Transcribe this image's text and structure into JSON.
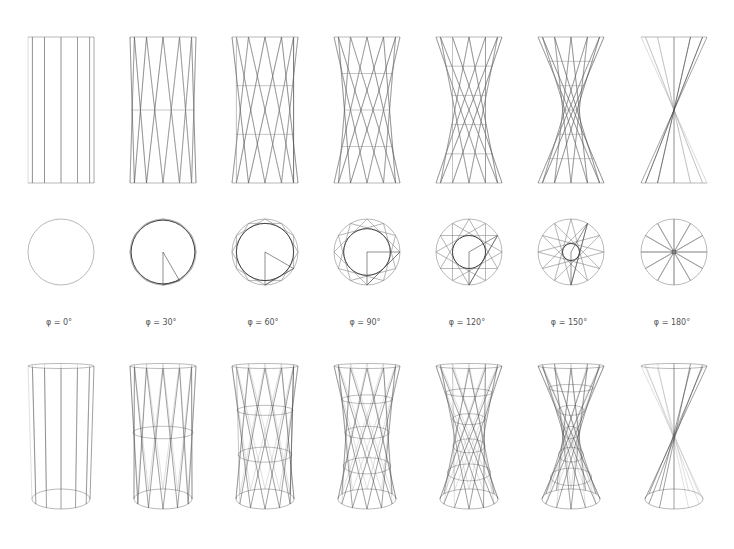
{
  "figure": {
    "rows": [
      "elevation",
      "plan",
      "perspective"
    ],
    "rod_count": 12,
    "line_color": "#8a8a8a",
    "dark_line_color": "#444444",
    "columns": [
      {
        "phi": 0,
        "label": "φ = 0°",
        "cx": 61
      },
      {
        "phi": 30,
        "label": "φ = 30°",
        "cx": 163
      },
      {
        "phi": 60,
        "label": "φ = 60°",
        "cx": 265
      },
      {
        "phi": 90,
        "label": "φ = 90°",
        "cx": 367
      },
      {
        "phi": 120,
        "label": "φ = 120°",
        "cx": 469
      },
      {
        "phi": 150,
        "label": "φ = 150°",
        "cx": 571
      },
      {
        "phi": 180,
        "label": "φ = 180°",
        "cx": 674
      }
    ],
    "elevation": {
      "top_y": 37,
      "bottom_y": 183,
      "radius": 33
    },
    "plan": {
      "cy": 252,
      "radius": 33
    },
    "perspective": {
      "top_y": 366,
      "bottom_y": 499,
      "radius": 33,
      "ellipse_ry": 10
    }
  }
}
